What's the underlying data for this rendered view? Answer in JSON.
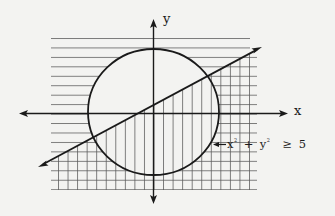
{
  "diagram": {
    "title": "",
    "axes": {
      "x_label": "x",
      "y_label": "y"
    },
    "annotation": {
      "arrow": "←",
      "x_term": "x",
      "x_exp": "2",
      "plus": "+",
      "y_term": "y",
      "y_exp": "2",
      "relation": "≥",
      "value": "5",
      "text": "x² + y² ≥ 5"
    },
    "elements": [
      {
        "type": "circle",
        "equation": "x² + y² = 5",
        "shading": "horizontal lines outside circle"
      },
      {
        "type": "line",
        "direction": "rising left-to-right",
        "shading": "vertical lines below line"
      }
    ],
    "colors": {
      "background": "#f3f3f1",
      "ink": "#1a1a1a",
      "hatch": "#555555"
    }
  }
}
